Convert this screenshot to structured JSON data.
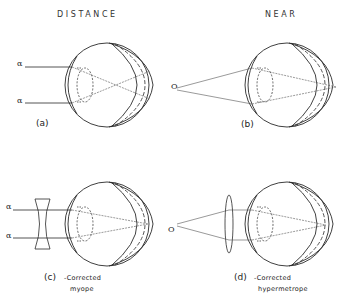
{
  "headings": {
    "distance": "DISTANCE",
    "near": "NEAR"
  },
  "panels": [
    {
      "id": "a",
      "caption": "(a)",
      "subtitle_1": "",
      "subtitle_2": "",
      "object": "distant",
      "ray_symbols": [
        "α",
        "α"
      ],
      "lens": "none",
      "focus": "in front of retina"
    },
    {
      "id": "b",
      "caption": "(b)",
      "subtitle_1": "",
      "subtitle_2": "",
      "object": "near point",
      "object_symbol": "O",
      "lens": "none",
      "focus": "behind retina"
    },
    {
      "id": "c",
      "caption": "(c)",
      "subtitle_1": "-Corrected",
      "subtitle_2": "myope",
      "object": "distant",
      "ray_symbols": [
        "α",
        "α"
      ],
      "lens": "concave",
      "focus": "on retina"
    },
    {
      "id": "d",
      "caption": "(d)",
      "subtitle_1": "-Corrected",
      "subtitle_2": "hypermetrope",
      "object": "near point",
      "object_symbol": "O",
      "lens": "convex",
      "focus": "on retina"
    }
  ],
  "colors": {
    "stroke": "#2a2a2a",
    "ray": "#555555",
    "background": "#ffffff"
  }
}
